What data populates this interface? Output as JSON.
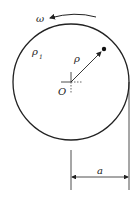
{
  "diagram": {
    "type": "rotating-disk-dimension",
    "labels": {
      "omega": "ω",
      "rho1": "ρ",
      "rho1_sub": "1",
      "rho": "ρ",
      "origin": "O",
      "dimension": "a"
    },
    "colors": {
      "stroke": "#222222",
      "background": "#ffffff"
    }
  }
}
